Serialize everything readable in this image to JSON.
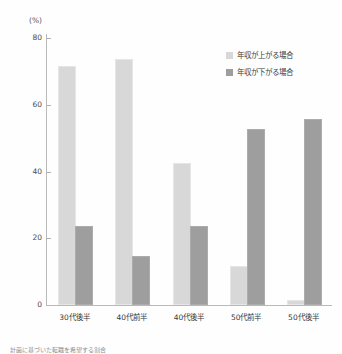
{
  "chart_data": {
    "type": "bar",
    "title": "",
    "xlabel": "",
    "ylabel": "",
    "unit_label": "(%)",
    "ylim": [
      0,
      80
    ],
    "yticks": [
      0,
      20,
      40,
      60,
      80
    ],
    "ytick_labels": [
      "0",
      "20",
      "40",
      "60",
      "80"
    ],
    "grid": false,
    "legend_position": "top-right",
    "categories": [
      "30代後半",
      "40代前半",
      "40代後半",
      "50代前半",
      "50代後半"
    ],
    "series": [
      {
        "name": "年収が上がる場合",
        "color": "#d8d8d8",
        "values": [
          71,
          73,
          42,
          11,
          1
        ]
      },
      {
        "name": "年収が下がる場合",
        "color": "#9e9e9e",
        "values": [
          23,
          14,
          23,
          52,
          55
        ]
      }
    ]
  },
  "footnote": "計画に基づいた転職を希望する割合"
}
